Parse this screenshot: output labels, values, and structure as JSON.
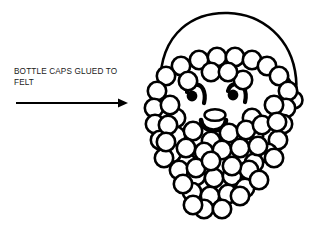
{
  "illustration": {
    "title": "Bottle cap Santa face craft diagram",
    "subject": "santa-face",
    "style": "black-and-white-line-art",
    "background_color": "#ffffff",
    "ink_color": "#000000"
  },
  "annotation": {
    "label": "BOTTLE CAPS GLUED TO\nFELT",
    "line1": "BOTTLE CAPS GLUED TO",
    "line2": "FELT",
    "text_color": "#1a1a1a",
    "arrow": {
      "name": "pointer-arrow",
      "direction": "right",
      "x_start": 16,
      "x_end": 126,
      "y": 103,
      "color": "#000000"
    }
  },
  "figure": {
    "hat": {
      "name": "santa-hat",
      "outline_color": "#000000",
      "stroke_width": 2.4,
      "pompom": {
        "cx": 294,
        "cy": 100,
        "r": 8.5
      }
    },
    "face": {
      "eyes": [
        {
          "name": "left-eye",
          "cx": 192,
          "cy": 95,
          "r": 5.2
        },
        {
          "name": "right-eye",
          "cx": 233,
          "cy": 94,
          "r": 5.2
        }
      ],
      "nose": {
        "name": "nose",
        "cx": 215,
        "cy": 116,
        "rx": 10,
        "ry": 5.5
      },
      "mouth": {
        "name": "mouth",
        "cx": 213,
        "cy": 126,
        "r": 12
      }
    },
    "caps": {
      "name": "bottle-cap-circles",
      "count": 63,
      "radius": 9.2,
      "fill": "#ffffff",
      "stroke": "#000000",
      "stroke_width": 2.6,
      "positions": [
        [
          199,
          60
        ],
        [
          217,
          57
        ],
        [
          235,
          57
        ],
        [
          252,
          60
        ],
        [
          267,
          66
        ],
        [
          181,
          66
        ],
        [
          166,
          76
        ],
        [
          279,
          76
        ],
        [
          157,
          91
        ],
        [
          154,
          108
        ],
        [
          288,
          91
        ],
        [
          286,
          108
        ],
        [
          155,
          124
        ],
        [
          160,
          140
        ],
        [
          283,
          124
        ],
        [
          278,
          140
        ],
        [
          172,
          153
        ],
        [
          187,
          163
        ],
        [
          268,
          153
        ],
        [
          254,
          163
        ],
        [
          176,
          118
        ],
        [
          176,
          136
        ],
        [
          252,
          118
        ],
        [
          254,
          136
        ],
        [
          193,
          131
        ],
        [
          211,
          141
        ],
        [
          229,
          133
        ],
        [
          246,
          130
        ],
        [
          168,
          125
        ],
        [
          262,
          125
        ],
        [
          186,
          148
        ],
        [
          204,
          152
        ],
        [
          222,
          150
        ],
        [
          240,
          148
        ],
        [
          258,
          146
        ],
        [
          179,
          170
        ],
        [
          196,
          176
        ],
        [
          214,
          178
        ],
        [
          232,
          176
        ],
        [
          249,
          170
        ],
        [
          192,
          192
        ],
        [
          210,
          196
        ],
        [
          228,
          194
        ],
        [
          245,
          188
        ],
        [
          204,
          209
        ],
        [
          222,
          209
        ],
        [
          164,
          158
        ],
        [
          274,
          158
        ],
        [
          170,
          105
        ],
        [
          274,
          105
        ],
        [
          188,
          81
        ],
        [
          243,
          80
        ],
        [
          211,
          72
        ],
        [
          228,
          72
        ],
        [
          196,
          168
        ],
        [
          232,
          166
        ],
        [
          166,
          142
        ],
        [
          277,
          122
        ],
        [
          240,
          196
        ],
        [
          193,
          205
        ],
        [
          259,
          180
        ],
        [
          183,
          184
        ],
        [
          211,
          161
        ]
      ]
    }
  }
}
